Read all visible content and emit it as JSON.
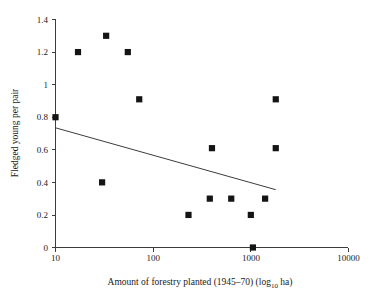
{
  "chart_data": {
    "type": "scatter",
    "title": "",
    "xlabel_parts": {
      "main_before": "Amount of forestry planted (1945–70) (log",
      "subscript": "10",
      "main_after": " ha)"
    },
    "xlabel": "Amount of forestry planted (1945–70) (log10 ha)",
    "ylabel": "Fledged young per pair",
    "xscale": "log",
    "yscale": "linear",
    "xlim": [
      10,
      10000
    ],
    "ylim": [
      0,
      1.4
    ],
    "grid": false,
    "legend": null,
    "xticks": [
      10,
      100,
      1000,
      10000
    ],
    "xtick_labels": [
      "10",
      "100",
      "1000",
      "10000"
    ],
    "yticks": [
      0,
      0.2,
      0.4,
      0.6,
      0.8,
      1.0,
      1.2,
      1.4
    ],
    "ytick_labels": [
      "0",
      "0.2",
      "0.4",
      "0.6",
      "0.8",
      "1",
      "1.2",
      "1.4"
    ],
    "marker": "filled-square",
    "marker_color": "#141414",
    "points": [
      {
        "x": 10,
        "y": 0.8
      },
      {
        "x": 17,
        "y": 1.2
      },
      {
        "x": 33,
        "y": 1.3
      },
      {
        "x": 30,
        "y": 0.4
      },
      {
        "x": 55,
        "y": 1.2
      },
      {
        "x": 72,
        "y": 0.91
      },
      {
        "x": 230,
        "y": 0.2
      },
      {
        "x": 400,
        "y": 0.61
      },
      {
        "x": 380,
        "y": 0.3
      },
      {
        "x": 630,
        "y": 0.3
      },
      {
        "x": 1000,
        "y": 0.2
      },
      {
        "x": 1050,
        "y": 0.0
      },
      {
        "x": 1400,
        "y": 0.3
      },
      {
        "x": 1800,
        "y": 0.91
      },
      {
        "x": 1800,
        "y": 0.61
      }
    ],
    "trend_line": {
      "name": "regression-line",
      "x_start": 10,
      "y_start": 0.735,
      "x_end": 1800,
      "y_end": 0.355,
      "color": "#3c3c3c"
    },
    "axis_color": "#3c3c3c",
    "background_color": "#ffffff"
  }
}
